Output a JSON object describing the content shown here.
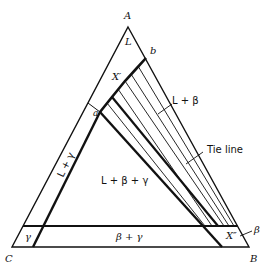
{
  "diagram": {
    "vertices": {
      "A": {
        "label": "A",
        "x": 128,
        "y": 27
      },
      "B": {
        "label": "B",
        "x": 249,
        "y": 247
      },
      "C": {
        "label": "C",
        "x": 12,
        "y": 247
      }
    },
    "points": {
      "a": {
        "label": "a",
        "x": 100,
        "y": 112
      },
      "b": {
        "label": "b",
        "x": 146,
        "y": 58
      },
      "X_prime": {
        "label": "X′"
      },
      "X_double_prime": {
        "label": "X″"
      }
    },
    "regions": {
      "L": "L",
      "L_beta": "L + β",
      "L_gamma": "L + γ",
      "L_beta_gamma": "L + β + γ",
      "beta_gamma": "β + γ",
      "gamma": "γ",
      "beta": "β"
    },
    "annotations": {
      "tie_line": "Tie line"
    },
    "colors": {
      "line": "#111111",
      "background": "#ffffff"
    }
  }
}
